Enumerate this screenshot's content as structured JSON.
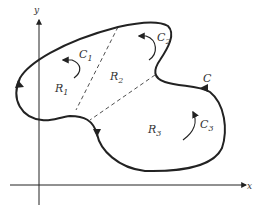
{
  "diagram": {
    "axes": {
      "x_label": "x",
      "y_label": "y"
    },
    "curve_label": "C",
    "regions": [
      {
        "label": "R",
        "sub": "1"
      },
      {
        "label": "R",
        "sub": "2"
      },
      {
        "label": "R",
        "sub": "3"
      }
    ],
    "circulations": [
      {
        "label": "C",
        "sub": "1"
      },
      {
        "label": "C",
        "sub": "2"
      },
      {
        "label": "C",
        "sub": "3"
      }
    ],
    "colors": {
      "ink": "#222222",
      "background": "#ffffff"
    }
  }
}
